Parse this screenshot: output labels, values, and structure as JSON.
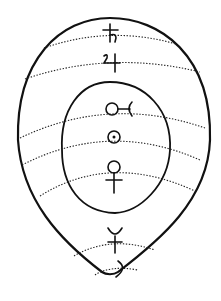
{
  "diagram": {
    "title": "",
    "colors": {
      "ink": "#111111",
      "background": "#ffffff"
    },
    "planets": [
      {
        "name": "Saturn",
        "glyph": "saturn-symbol",
        "region": "outer"
      },
      {
        "name": "Jupiter",
        "glyph": "jupiter-symbol",
        "region": "outer"
      },
      {
        "name": "Mars",
        "glyph": "mars-symbol",
        "region": "inner"
      },
      {
        "name": "Sun",
        "glyph": "sun-symbol",
        "region": "inner"
      },
      {
        "name": "Venus",
        "glyph": "venus-symbol",
        "region": "inner"
      },
      {
        "name": "Mercury",
        "glyph": "mercury-symbol",
        "region": "outer"
      },
      {
        "name": "Moon",
        "glyph": "moon-symbol",
        "region": "outer"
      }
    ]
  }
}
